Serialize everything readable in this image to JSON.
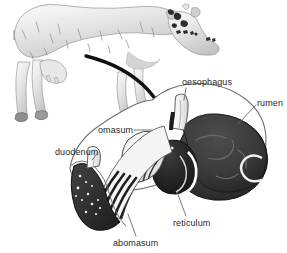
{
  "figure": {
    "background_color": "#ffffff",
    "label_color": "#1f1f1f",
    "labels": [
      {
        "id": "oesophagus",
        "text": "oesophagus"
      },
      {
        "id": "rumen",
        "text": "rumen"
      },
      {
        "id": "omasum",
        "text": "omasum"
      },
      {
        "id": "duodenum",
        "text": "duodenum"
      },
      {
        "id": "reticulum",
        "text": "reticulum"
      },
      {
        "id": "abomasum",
        "text": "abomasum"
      }
    ],
    "parts": {
      "cow": {
        "name": "cow-illustration",
        "fill": "#d9d9d9"
      },
      "arrow": {
        "name": "pointer-arrow",
        "color": "#111111"
      },
      "rumen": {
        "fill": "#3a3a3a"
      },
      "reticulum": {
        "fill": "#2a2a2a"
      },
      "omasum": {
        "fill": "#f2f2f2"
      },
      "abomasum": {
        "fill": "#333333"
      },
      "oesophagus": {
        "fill": "#fafafa"
      },
      "duodenum": {
        "fill": "#fafafa"
      }
    }
  }
}
